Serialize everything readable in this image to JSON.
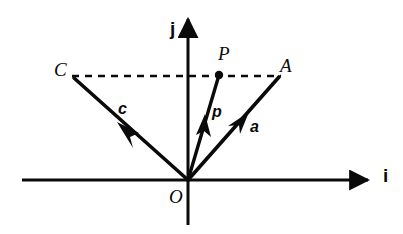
{
  "figure": {
    "kind": "vector-diagram",
    "background_color": "#ffffff",
    "ink_color": "#0a0a0a"
  },
  "axes": {
    "horizontal": {
      "label": "i",
      "name": "i-axis",
      "x_start": 22,
      "x_end": 375,
      "y": 180,
      "arrow": "right"
    },
    "vertical": {
      "label": "j",
      "name": "j-axis",
      "y_start": 225,
      "y_end": 12,
      "x": 188,
      "arrow": "up"
    }
  },
  "points": [
    {
      "id": "C",
      "label": "C",
      "x": 72,
      "y": 76,
      "dot": false
    },
    {
      "id": "A",
      "label": "A",
      "x": 280,
      "y": 76,
      "dot": false
    },
    {
      "id": "P",
      "label": "P",
      "x": 219,
      "y": 75,
      "dot": true
    },
    {
      "id": "O",
      "label": "O",
      "x": 188,
      "y": 180,
      "dot": false
    }
  ],
  "vectors": [
    {
      "id": "c",
      "label": "c",
      "name": "vector-c",
      "from": {
        "x": 188,
        "y": 180
      },
      "to": {
        "x": 74,
        "y": 78
      },
      "arrow_at": "mid",
      "style": "solid",
      "bold": true
    },
    {
      "id": "p",
      "label": "p",
      "name": "vector-p",
      "from": {
        "x": 188,
        "y": 180
      },
      "to": {
        "x": 219,
        "y": 75
      },
      "arrow_at": "mid",
      "style": "solid",
      "bold": true
    },
    {
      "id": "a",
      "label": "a",
      "name": "vector-a",
      "from": {
        "x": 188,
        "y": 180
      },
      "to": {
        "x": 279,
        "y": 77
      },
      "arrow_at": "mid",
      "style": "solid",
      "bold": true
    }
  ],
  "construction_lines": [
    {
      "id": "CA",
      "name": "dashed-line-C-to-A",
      "from": {
        "x": 72,
        "y": 76
      },
      "to": {
        "x": 281,
        "y": 76
      },
      "style": "dashed",
      "dash_pattern": "7 6"
    }
  ],
  "labels": {
    "point_C": "C",
    "point_A": "A",
    "point_P": "P",
    "point_O": "O",
    "vector_c": "c",
    "vector_p": "p",
    "vector_a": "a",
    "axis_i": "i",
    "axis_j": "j"
  }
}
